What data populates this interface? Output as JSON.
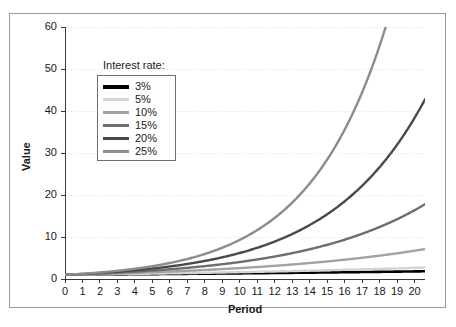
{
  "chart_data": {
    "type": "line",
    "title": "",
    "xlabel": "Period",
    "ylabel": "Value",
    "xlim": [
      0,
      20.6
    ],
    "ylim": [
      0,
      60
    ],
    "xticks": [
      0,
      1,
      2,
      3,
      4,
      5,
      6,
      7,
      8,
      9,
      10,
      11,
      12,
      13,
      14,
      15,
      16,
      17,
      18,
      19,
      20
    ],
    "yticks": [
      0,
      10,
      20,
      30,
      40,
      50,
      60
    ],
    "grid": "horizontal-dotted",
    "legend_position": "upper-left-inside",
    "legend_title": "Interest rate:",
    "x": [
      0,
      1,
      2,
      3,
      4,
      5,
      6,
      7,
      8,
      9,
      10,
      11,
      12,
      13,
      14,
      15,
      16,
      17,
      18,
      19,
      20
    ],
    "series": [
      {
        "name": "3%",
        "rate": 0.03,
        "color": "#000000",
        "values": [
          1.0,
          1.03,
          1.06,
          1.09,
          1.13,
          1.16,
          1.19,
          1.23,
          1.27,
          1.3,
          1.34,
          1.38,
          1.43,
          1.47,
          1.51,
          1.56,
          1.6,
          1.65,
          1.7,
          1.75,
          1.81
        ]
      },
      {
        "name": "5%",
        "rate": 0.05,
        "color": "#d4d4d4",
        "values": [
          1.0,
          1.05,
          1.1,
          1.16,
          1.22,
          1.28,
          1.34,
          1.41,
          1.48,
          1.55,
          1.63,
          1.71,
          1.8,
          1.89,
          1.98,
          2.08,
          2.18,
          2.29,
          2.41,
          2.53,
          2.65
        ]
      },
      {
        "name": "10%",
        "rate": 0.1,
        "color": "#a3a3a3",
        "values": [
          1.0,
          1.1,
          1.21,
          1.33,
          1.46,
          1.61,
          1.77,
          1.95,
          2.14,
          2.36,
          2.59,
          2.85,
          3.14,
          3.45,
          3.8,
          4.18,
          4.59,
          5.05,
          5.56,
          6.12,
          6.73
        ]
      },
      {
        "name": "15%",
        "rate": 0.15,
        "color": "#6e6e6e",
        "values": [
          1.0,
          1.15,
          1.32,
          1.52,
          1.75,
          2.01,
          2.31,
          2.66,
          3.06,
          3.52,
          4.05,
          4.65,
          5.35,
          6.15,
          7.08,
          8.14,
          9.36,
          10.76,
          12.38,
          14.23,
          16.37
        ]
      },
      {
        "name": "20%",
        "rate": 0.2,
        "color": "#4a4a4a",
        "values": [
          1.0,
          1.2,
          1.44,
          1.73,
          2.07,
          2.49,
          2.99,
          3.58,
          4.3,
          5.16,
          6.19,
          7.43,
          8.92,
          10.7,
          12.84,
          15.41,
          18.49,
          22.19,
          26.62,
          31.95,
          38.34
        ]
      },
      {
        "name": "25%",
        "rate": 0.25,
        "color": "#8c8c8c",
        "values": [
          1.0,
          1.25,
          1.56,
          1.95,
          2.44,
          3.05,
          3.81,
          4.77,
          5.96,
          7.45,
          9.31,
          11.64,
          14.55,
          18.19,
          22.74,
          28.42,
          35.53,
          44.41,
          55.51,
          69.39,
          86.74
        ]
      }
    ]
  },
  "legend": {
    "title": "Interest rate:",
    "entries": [
      {
        "label": "3%",
        "color": "#000000"
      },
      {
        "label": "5%",
        "color": "#d4d4d4"
      },
      {
        "label": "10%",
        "color": "#a3a3a3"
      },
      {
        "label": "15%",
        "color": "#6e6e6e"
      },
      {
        "label": "20%",
        "color": "#4a4a4a"
      },
      {
        "label": "25%",
        "color": "#8c8c8c"
      }
    ]
  },
  "axes": {
    "y_title": "Value",
    "x_title": "Period"
  },
  "style": {
    "axis_color": "#3a3a3a",
    "grid_color": "#e3e3e3",
    "frame_color": "#9a9a9a",
    "text_color": "#1a1a1a",
    "background": "#ffffff"
  }
}
